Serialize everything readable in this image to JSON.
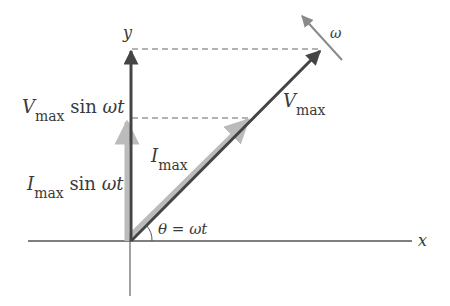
{
  "diagram": {
    "type": "phasor-diagram",
    "axes": {
      "x_label": "x",
      "y_label": "y"
    },
    "phasors": [
      {
        "name": "V_max",
        "label_main": "V",
        "label_sub": "max",
        "color": "#4a4a4a"
      },
      {
        "name": "I_max",
        "label_main": "I",
        "label_sub": "max",
        "color": "#b8b8b8"
      }
    ],
    "projections": {
      "voltage": {
        "main": "V",
        "sub": "max",
        "tail": " sin ",
        "omega_t": "ωt"
      },
      "current": {
        "main": "I",
        "sub": "max",
        "tail": " sin ",
        "omega_t": "ωt"
      }
    },
    "angle_label": "θ = ωt",
    "rotation_label": "ω",
    "colors": {
      "axis": "#555555",
      "dashed": "#666666",
      "voltage": "#4a4a4a",
      "current": "#b8b8b8",
      "rotation": "#8a8a8a"
    }
  }
}
